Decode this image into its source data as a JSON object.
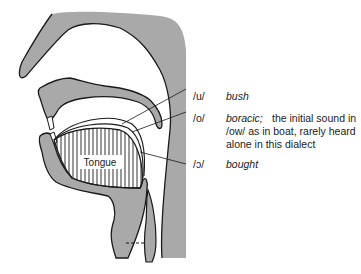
{
  "diagram": {
    "colors": {
      "tissue": "#a9a9a9",
      "outline": "#1a1a1a",
      "background": "#ffffff"
    },
    "tongue_label": "Tongue",
    "vowels": [
      {
        "symbol": "/u/",
        "word": "bush",
        "note": ""
      },
      {
        "symbol": "/o/",
        "word": "boracic;",
        "note": "the initial sound in /ow/ as in boat, rarely heard alone in this dialect"
      },
      {
        "symbol": "/ɔ/",
        "word": "bought",
        "note": ""
      }
    ]
  }
}
